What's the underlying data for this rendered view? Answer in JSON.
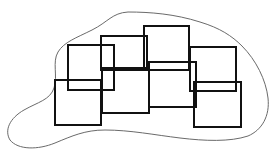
{
  "diagram": {
    "colors": {
      "background": "#ffffff",
      "blob_stroke": "#6a6a6a",
      "rect_stroke": "#111111"
    },
    "blob": {
      "path": "M128,12 C150,12 175,14 200,22 C220,28 232,36 242,46 C256,60 266,80 268,98 C270,116 262,130 248,136 C230,142 205,141 180,138 C155,135 130,130 105,130 C85,130 72,136 55,143 C38,150 18,150 10,140 C4,130 10,118 24,110 C38,102 50,100 54,88 C58,76 52,62 58,52 C64,42 76,38 92,30 C108,22 112,13 128,12 Z"
    },
    "rectangles": [
      {
        "id": "A",
        "x": 68,
        "y": 45,
        "w": 46,
        "h": 45
      },
      {
        "id": "B",
        "x": 55,
        "y": 80,
        "w": 46,
        "h": 45
      },
      {
        "id": "C",
        "x": 101,
        "y": 36,
        "w": 46,
        "h": 34
      },
      {
        "id": "H",
        "x": 102,
        "y": 68,
        "w": 47,
        "h": 45
      },
      {
        "id": "D",
        "x": 144,
        "y": 26,
        "w": 45,
        "h": 44
      },
      {
        "id": "F",
        "x": 149,
        "y": 62,
        "w": 47,
        "h": 45
      },
      {
        "id": "E",
        "x": 190,
        "y": 47,
        "w": 46,
        "h": 44
      },
      {
        "id": "G",
        "x": 194,
        "y": 82,
        "w": 47,
        "h": 45
      }
    ]
  }
}
